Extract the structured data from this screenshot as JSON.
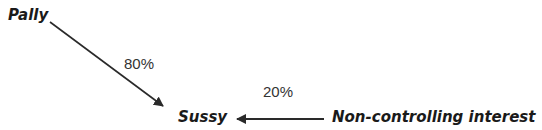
{
  "diagram": {
    "nodes": {
      "parent": "Pally",
      "subsidiary": "Sussy",
      "nci": "Non-controlling interest"
    },
    "edges": [
      {
        "from": "Pally",
        "to": "Sussy",
        "label": "80%"
      },
      {
        "from": "Non-controlling interest",
        "to": "Sussy",
        "label": "20%"
      }
    ],
    "colors": {
      "text": "#1a1a1a",
      "arrow": "#2a2a2a",
      "background": "#ffffff"
    }
  }
}
